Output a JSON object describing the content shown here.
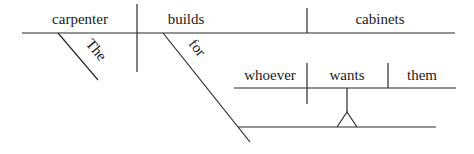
{
  "diagram": {
    "type": "sentence-diagram",
    "main_clause": {
      "subject": "carpenter",
      "subject_modifier": "The",
      "verb": "builds",
      "verb_modifier": "for",
      "direct_object": "cabinets"
    },
    "noun_clause": {
      "subject": "whoever",
      "verb": "wants",
      "direct_object": "them"
    }
  }
}
